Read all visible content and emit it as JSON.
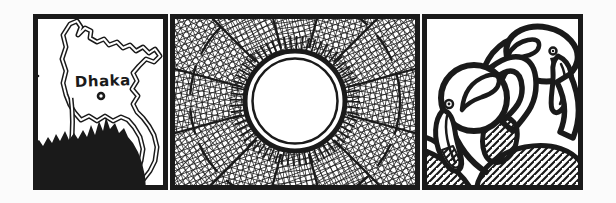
{
  "comic": {
    "panel_count": 3,
    "panels": [
      {
        "name": "bangladesh-map-panel",
        "label": "Dhaka"
      },
      {
        "name": "sun-over-crosshatch-panel",
        "label": ""
      },
      {
        "name": "two-flamingos-panel",
        "label": ""
      }
    ]
  },
  "colors": {
    "ink": "#1a1a1a",
    "paper": "#ffffff"
  }
}
